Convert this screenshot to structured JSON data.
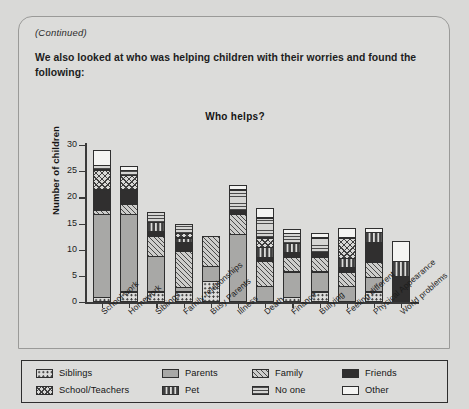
{
  "page": {
    "continued_note": "(Continued)",
    "intro_text": "We also looked at who was helping children with their worries and found the following:"
  },
  "chart_data": {
    "type": "bar",
    "subtype": "stacked-vertical",
    "title": "Who helps?",
    "xlabel": "",
    "ylabel": "Number of children",
    "ylim": [
      0,
      30
    ],
    "yticks": [
      0,
      5,
      10,
      15,
      20,
      25,
      30
    ],
    "grid": false,
    "legend_position": "bottom",
    "categories": [
      "School work",
      "Homework",
      "Siblings",
      "Family relationships",
      "Busy Parents",
      "Illness",
      "Death",
      "Finance",
      "Bullying",
      "Feeling different",
      "Physical Appearance",
      "World problems"
    ],
    "series": [
      {
        "name": "Siblings",
        "pattern": "dotted-circles",
        "values": [
          1,
          2,
          2,
          2,
          4,
          0,
          0,
          1,
          2,
          0,
          2,
          0
        ]
      },
      {
        "name": "Parents",
        "pattern": "solid-grey",
        "values": [
          16,
          15,
          7,
          1,
          3,
          13,
          3,
          5,
          4,
          3,
          3,
          0
        ]
      },
      {
        "name": "Family",
        "pattern": "diagonal-hatch",
        "values": [
          1,
          2,
          4,
          7,
          6,
          4,
          5,
          3,
          3,
          3,
          3,
          0
        ]
      },
      {
        "name": "Friends",
        "pattern": "solid-black",
        "values": [
          4,
          3,
          1,
          2,
          0,
          1,
          1,
          1,
          1,
          1,
          4,
          5
        ]
      },
      {
        "name": "Pet",
        "pattern": "dashes",
        "values": [
          0,
          0,
          2,
          1,
          0,
          0,
          2,
          2,
          0,
          2,
          2,
          3
        ]
      },
      {
        "name": "School/Teachers",
        "pattern": "crosshatch",
        "values": [
          4,
          3,
          0,
          1,
          0,
          0,
          2,
          0,
          0,
          4,
          0,
          0
        ]
      },
      {
        "name": "No one",
        "pattern": "horizontal-lines",
        "values": [
          1,
          1,
          2,
          2,
          0,
          4,
          4,
          2,
          3,
          0,
          0,
          0
        ]
      },
      {
        "name": "Other",
        "pattern": "white",
        "values": [
          3,
          1,
          0,
          0,
          0,
          1,
          2,
          1,
          1,
          2,
          1,
          4
        ]
      }
    ],
    "totals": [
      30,
      27,
      18,
      16,
      13,
      23,
      19,
      15,
      14,
      15,
      15,
      12
    ]
  },
  "legend": {
    "items": [
      {
        "label": "Siblings",
        "pattern": "dotted-circles"
      },
      {
        "label": "School/Teachers",
        "pattern": "crosshatch"
      },
      {
        "label": "Parents",
        "pattern": "solid-grey"
      },
      {
        "label": "Pet",
        "pattern": "dashes"
      },
      {
        "label": "Family",
        "pattern": "diagonal-hatch"
      },
      {
        "label": "No one",
        "pattern": "horizontal-lines"
      },
      {
        "label": "Friends",
        "pattern": "solid-black"
      },
      {
        "label": "Other",
        "pattern": "white"
      }
    ]
  },
  "colors": {
    "page_background": "#d9d9d7",
    "card_background": "#dcdcda",
    "axis": "#3a3a3a",
    "parents_fill": "#a8a8a6",
    "friends_fill": "#302f2f",
    "other_fill": "#f4f4f2",
    "text": "#1d1d1d"
  }
}
